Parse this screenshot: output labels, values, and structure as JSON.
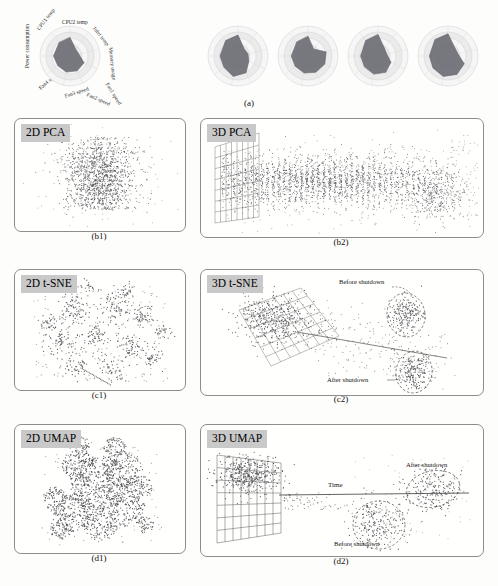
{
  "figure": {
    "panel_a": {
      "caption": "(a)",
      "radar_axes": [
        {
          "key": "cpu2_temp",
          "label": "CPU2 temp",
          "angle": 90
        },
        {
          "key": "inlet_temp",
          "label": "Inlet temp",
          "angle": 51.4
        },
        {
          "key": "memory_usage",
          "label": "Memory usage",
          "angle": 12.8
        },
        {
          "key": "fan1_speed",
          "label": "Fan1 speed",
          "angle": -25.7
        },
        {
          "key": "fan2_speed",
          "label": "Fan2 speed",
          "angle": -64.3
        },
        {
          "key": "fan3_speed",
          "label": "Fan3 speed",
          "angle": -103
        },
        {
          "key": "fan4_speed",
          "label": "Fan4 speed",
          "angle": -141.4
        },
        {
          "key": "power_consumption",
          "label": "Power consumption",
          "angle": 180
        },
        {
          "key": "cpu1_temp",
          "label": "CPU1 temp",
          "angle": 128.6
        }
      ],
      "radar_rings": 5,
      "snapshots": [
        {
          "id": "t1",
          "values": [
            0.62,
            0.3,
            0.3,
            0.52,
            0.55,
            0.55,
            0.52,
            0.55,
            0.58
          ]
        },
        {
          "id": "t2",
          "values": [
            0.7,
            0.32,
            0.34,
            0.4,
            0.62,
            0.7,
            0.6,
            0.6,
            0.66
          ]
        },
        {
          "id": "t3",
          "values": [
            0.66,
            0.3,
            0.62,
            0.62,
            0.6,
            0.58,
            0.55,
            0.56,
            0.6
          ]
        },
        {
          "id": "t4",
          "values": [
            0.72,
            0.34,
            0.3,
            0.48,
            0.6,
            0.62,
            0.58,
            0.58,
            0.66
          ]
        },
        {
          "id": "t5",
          "values": [
            0.74,
            0.36,
            0.34,
            0.6,
            0.68,
            0.7,
            0.64,
            0.62,
            0.7
          ]
        }
      ]
    },
    "panels": [
      {
        "id": "b1",
        "label": "2D PCA",
        "caption": "(b1)",
        "type": "scatter-2d",
        "method": "PCA",
        "dims": 2
      },
      {
        "id": "b2",
        "label": "3D PCA",
        "caption": "(b2)",
        "type": "scatter-3d",
        "method": "PCA",
        "dims": 3
      },
      {
        "id": "c1",
        "label": "2D t-SNE",
        "caption": "(c1)",
        "type": "scatter-2d",
        "method": "t-SNE",
        "dims": 2
      },
      {
        "id": "c2",
        "label": "3D t-SNE",
        "caption": "(c2)",
        "type": "scatter-3d",
        "method": "t-SNE",
        "dims": 3
      },
      {
        "id": "d1",
        "label": "2D UMAP",
        "caption": "(d1)",
        "type": "scatter-2d",
        "method": "UMAP",
        "dims": 2
      },
      {
        "id": "d2",
        "label": "3D UMAP",
        "caption": "(d2)",
        "type": "scatter-3d",
        "method": "UMAP",
        "dims": 3
      }
    ],
    "annotations": {
      "c2_before": "Before shutdown",
      "c2_after": "After shutdown",
      "d2_after": "After shutdown",
      "d2_before": "Before shutdown",
      "d2_time": "Time"
    },
    "colors": {
      "point": "#4a4a52",
      "label_badge_bg": "#c9c9c9",
      "panel_border": "#8d8d8d",
      "radar_fill": "#6e6e76",
      "radar_ring": "#cfcfcf",
      "grid": "#5a5a5a",
      "background": "#fdfdfb"
    }
  },
  "chart_data": {
    "type": "scatter",
    "subplots": [
      {
        "panel": "a",
        "type": "radar",
        "title": "Radar snapshots of 9 telemetry channels",
        "categories": [
          "CPU2 temp",
          "Inlet temp",
          "Memory usage",
          "Fan1 speed",
          "Fan2 speed",
          "Fan3 speed",
          "Fan4 speed",
          "Power consumption",
          "CPU1 temp"
        ],
        "series": [
          {
            "name": "t1",
            "values": [
              0.62,
              0.3,
              0.3,
              0.52,
              0.55,
              0.55,
              0.52,
              0.55,
              0.58
            ]
          },
          {
            "name": "t2",
            "values": [
              0.7,
              0.32,
              0.34,
              0.4,
              0.62,
              0.7,
              0.6,
              0.6,
              0.66
            ]
          },
          {
            "name": "t3",
            "values": [
              0.66,
              0.3,
              0.62,
              0.62,
              0.6,
              0.58,
              0.55,
              0.56,
              0.6
            ]
          },
          {
            "name": "t4",
            "values": [
              0.72,
              0.34,
              0.3,
              0.48,
              0.6,
              0.62,
              0.58,
              0.58,
              0.66
            ]
          },
          {
            "name": "t5",
            "values": [
              0.74,
              0.36,
              0.34,
              0.6,
              0.68,
              0.7,
              0.64,
              0.62,
              0.7
            ]
          }
        ],
        "rlim": [
          0,
          1
        ],
        "grid": true,
        "legend": "none"
      },
      {
        "panel": "b1",
        "type": "scatter",
        "title": "2D PCA",
        "xlabel": "PC1",
        "ylabel": "PC2",
        "grid": false,
        "legend": "none",
        "n_points": 2600
      },
      {
        "panel": "b2",
        "type": "scatter",
        "title": "3D PCA",
        "xlabel": "PC1",
        "ylabel": "PC2",
        "zlabel": "PC3",
        "grid": true,
        "legend": "none",
        "n_points": 3000
      },
      {
        "panel": "c1",
        "type": "scatter",
        "title": "2D t-SNE",
        "xlabel": "t-SNE 1",
        "ylabel": "t-SNE 2",
        "grid": false,
        "legend": "none",
        "n_points": 900
      },
      {
        "panel": "c2",
        "type": "scatter",
        "title": "3D t-SNE",
        "xlabel": "t-SNE 1",
        "ylabel": "t-SNE 2",
        "zlabel": "t-SNE 3",
        "grid": true,
        "legend": "none",
        "n_points": 900,
        "annotations": [
          "Before shutdown",
          "After shutdown"
        ]
      },
      {
        "panel": "d1",
        "type": "scatter",
        "title": "2D UMAP",
        "xlabel": "UMAP 1",
        "ylabel": "UMAP 2",
        "grid": false,
        "legend": "none",
        "n_points": 1100
      },
      {
        "panel": "d2",
        "type": "scatter",
        "title": "3D UMAP",
        "xlabel": "UMAP 1",
        "ylabel": "UMAP 2",
        "zlabel": "UMAP 3",
        "grid": true,
        "legend": "none",
        "n_points": 1100,
        "annotations": [
          "After shutdown",
          "Before shutdown",
          "Time"
        ]
      }
    ]
  }
}
